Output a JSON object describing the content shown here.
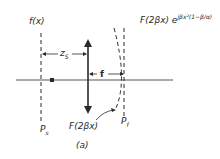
{
  "figure": {
    "caption": "(a)",
    "labels": {
      "input_function": "f(x)",
      "distance_zs": "z",
      "distance_zs_sub": "S",
      "focal_length": "f",
      "output_top_prefix": "F(2βx) e",
      "output_top_exponent": "jβx²(1−β/α)",
      "output_bottom": "F(2βx)",
      "plane_source": "P",
      "plane_source_sub": "s",
      "plane_fourier": "P",
      "plane_fourier_sub": "f"
    },
    "colors": {
      "ink": "#2a2a2a",
      "background": "#ffffff"
    }
  }
}
